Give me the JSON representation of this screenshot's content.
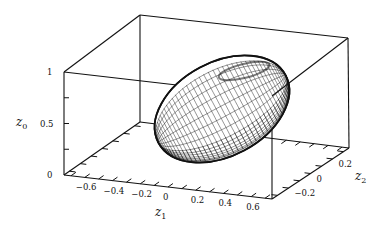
{
  "chart_data": {
    "type": "surface3d",
    "title": "",
    "surface": "ellipsoid",
    "axes": {
      "z1": {
        "label": "z",
        "sub": "1",
        "range": [
          -0.75,
          0.75
        ],
        "ticks": [
          "-0.6",
          "-0.4",
          "-0.2",
          "0",
          "0.2",
          "0.4",
          "0.6"
        ]
      },
      "z2": {
        "label": "z",
        "sub": "2",
        "range": [
          -0.35,
          0.35
        ],
        "ticks": [
          "-0.2",
          "0",
          "0.2"
        ]
      },
      "z0": {
        "label": "z",
        "sub": "0",
        "range": [
          0,
          1
        ],
        "ticks": [
          "0",
          "0.5",
          "1"
        ]
      }
    },
    "box": {
      "front_bottom_left": [
        64,
        175
      ],
      "front_bottom_right": [
        272,
        199
      ],
      "back_bottom_right": [
        349,
        148
      ],
      "back_bottom_left": [
        140,
        122
      ],
      "front_top_left": [
        64,
        72
      ],
      "back_top_left": [
        140,
        15
      ],
      "back_top_right": [
        348,
        38
      ]
    },
    "ellipsoid": {
      "center_px": [
        222,
        109
      ],
      "semi_axes_px": [
        72,
        47
      ],
      "rotation_deg": -28,
      "lat_lines": 26,
      "lon_lines": 44,
      "color": "#111111"
    },
    "grid": false,
    "legend": null
  }
}
